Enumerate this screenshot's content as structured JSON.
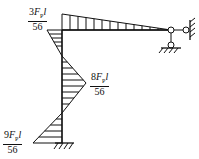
{
  "diagram": {
    "type": "bending-moment-diagram",
    "labels": [
      {
        "id": "top",
        "numerator_coef": "3",
        "numerator_var": "F",
        "numerator_sub": "P",
        "numerator_tail": "l",
        "denominator": "56"
      },
      {
        "id": "mid",
        "numerator_coef": "8",
        "numerator_var": "F",
        "numerator_sub": "P",
        "numerator_tail": "l",
        "denominator": "56"
      },
      {
        "id": "bottom",
        "numerator_coef": "9",
        "numerator_var": "F",
        "numerator_sub": "P",
        "numerator_tail": "l",
        "denominator": "56"
      }
    ],
    "colors": {
      "line": "#111111",
      "background": "#ffffff"
    }
  }
}
